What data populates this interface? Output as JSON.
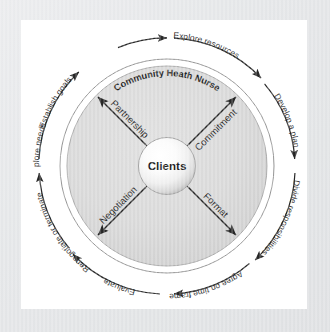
{
  "diagram": {
    "title": "Community Heath Nurse",
    "center_label": "Clients",
    "type": "circular process diagram",
    "outer_process_steps": [
      {
        "id": "establish-goals",
        "label": "Establish goals"
      },
      {
        "id": "explore-resources",
        "label": "Explore resources"
      },
      {
        "id": "develop-a-plan",
        "label": "Develop a plan"
      },
      {
        "id": "divide-responsibilities",
        "label": "Divide responsibilities"
      },
      {
        "id": "agree-on-time-frame",
        "label": "Agree on time frame"
      },
      {
        "id": "evaluate",
        "label": "Evaluate"
      },
      {
        "id": "renegotiate-or-terminate",
        "label": "Renegotiate or terminate"
      },
      {
        "id": "explore-needs",
        "label": "Explore needs"
      }
    ],
    "inner_relationship_axes": [
      {
        "id": "partnership",
        "label": "Partnership",
        "position": "upper-left"
      },
      {
        "id": "commitment",
        "label": "Commitment",
        "position": "upper-right"
      },
      {
        "id": "negotiation",
        "label": "Negotiation",
        "position": "lower-left"
      },
      {
        "id": "format",
        "label": "Format",
        "position": "lower-right"
      }
    ],
    "colors": {
      "frame": "#e2e4e6",
      "canvas": "#ffffff",
      "disc_fill": "#d4d4d4",
      "disc_stroke": "#9a9a9a",
      "ring_stroke": "#7a7a7a",
      "arc_stroke": "#1a1a1a",
      "arrow_stroke": "#1a1a1a",
      "text": "#111111",
      "center_sphere_light": "#ffffff",
      "center_sphere_dark": "#b8b8b8"
    }
  }
}
